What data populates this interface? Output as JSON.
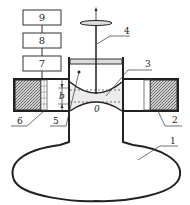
{
  "diagram": {
    "title": "",
    "boxes": [
      {
        "id": "box-9",
        "label": "9"
      },
      {
        "id": "box-8",
        "label": "8"
      },
      {
        "id": "box-7",
        "label": "7"
      }
    ],
    "callouts": {
      "bowl": "1",
      "right_magnet": "2",
      "membrane": "3",
      "piston_rod": "4",
      "inner_wall": "5",
      "left_magnet": "6"
    },
    "gap_label": "b",
    "origin_label": "0",
    "colors": {
      "stroke": "#222222",
      "hatch": "#888888",
      "fluid": "#ececec"
    }
  }
}
